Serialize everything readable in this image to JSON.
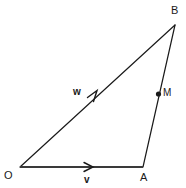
{
  "figure": {
    "type": "geometry-diagram",
    "width": 186,
    "height": 188,
    "background_color": "#ffffff",
    "stroke_color": "#1a1a1a",
    "vector_stroke_color": "#3a3a3a"
  },
  "vertices": [
    {
      "name": "O",
      "label": "O",
      "x": 20,
      "y": 167
    },
    {
      "name": "A",
      "label": "A",
      "x": 143,
      "y": 167
    },
    {
      "name": "B",
      "label": "B",
      "x": 175,
      "y": 25
    }
  ],
  "points": [
    {
      "name": "M",
      "label": "M",
      "x": 158,
      "y": 94,
      "marker": "filled-dot"
    }
  ],
  "edges": [
    {
      "name": "OA",
      "from": "O",
      "to": "A",
      "stroke_width": 2.2
    },
    {
      "name": "OB",
      "from": "O",
      "to": "B",
      "stroke_width": 1.2
    },
    {
      "name": "AB",
      "from": "A",
      "to": "B",
      "stroke_width": 1.2
    }
  ],
  "vectors": [
    {
      "name": "v",
      "label": "v",
      "along_edge": "OA",
      "arrow_x": 92,
      "arrow_y": 167,
      "direction": "right"
    },
    {
      "name": "w",
      "label": "w",
      "along_edge": "OB",
      "arrow_x": 96,
      "arrow_y": 96,
      "direction": "up-right"
    }
  ],
  "labels": {
    "O": "O",
    "A": "A",
    "B": "B",
    "M": "M",
    "v": "v",
    "w": "w"
  }
}
